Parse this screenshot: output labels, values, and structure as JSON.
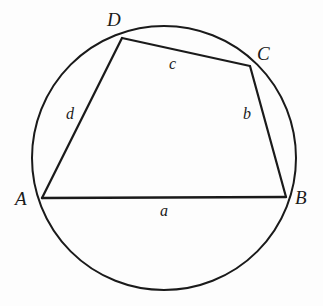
{
  "figure": {
    "kind": "cyclic-quadrilateral-in-circle",
    "background_color": "#fdfdfd",
    "stroke_color": "#1a1a1a",
    "label_color": "#1a1a1a"
  },
  "circle": {
    "center_x": 164,
    "center_y": 158,
    "radius": 132,
    "stroke_width": 2.0
  },
  "vertices": [
    {
      "id": "A",
      "label": "A",
      "x": 42,
      "y": 198
    },
    {
      "id": "B",
      "label": "B",
      "x": 286,
      "y": 197
    },
    {
      "id": "C",
      "label": "C",
      "x": 250,
      "y": 66
    },
    {
      "id": "D",
      "label": "D",
      "x": 122,
      "y": 38
    }
  ],
  "sides": [
    {
      "id": "a",
      "label": "a",
      "from": "A",
      "to": "B",
      "x1": 42,
      "y1": 198,
      "x2": 286,
      "y2": 197
    },
    {
      "id": "b",
      "label": "b",
      "from": "B",
      "to": "C",
      "x1": 286,
      "y1": 197,
      "x2": 250,
      "y2": 66
    },
    {
      "id": "c",
      "label": "c",
      "from": "C",
      "to": "D",
      "x1": 250,
      "y1": 66,
      "x2": 122,
      "y2": 38
    },
    {
      "id": "d",
      "label": "d",
      "from": "D",
      "to": "A",
      "x1": 122,
      "y1": 38,
      "x2": 42,
      "y2": 198
    }
  ]
}
